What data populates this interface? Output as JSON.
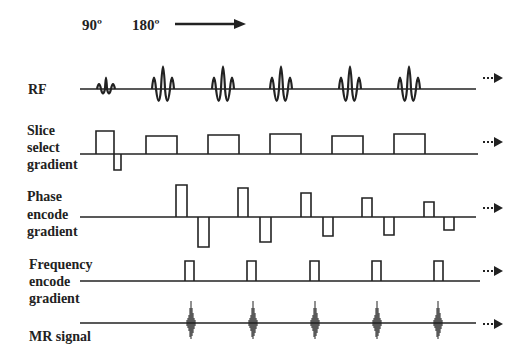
{
  "header": {
    "angle_90": "90º",
    "angle_180": "180º",
    "time_arrow": "right-arrow"
  },
  "rows": [
    {
      "id": "rf",
      "label_lines": [
        "RF"
      ],
      "continuation": "···▶"
    },
    {
      "id": "slice",
      "label_lines": [
        "Slice",
        "select",
        "gradient"
      ],
      "continuation": "···▶"
    },
    {
      "id": "phase",
      "label_lines": [
        "Phase",
        "encode",
        "gradient"
      ],
      "continuation": "···▶"
    },
    {
      "id": "frequency",
      "label_lines": [
        "Frequency",
        "encode",
        "gradient"
      ],
      "continuation": "···▶"
    },
    {
      "id": "mr",
      "label_lines": [
        "MR signal"
      ],
      "continuation": "···▶"
    }
  ],
  "colors": {
    "line": "#222222",
    "background": "#ffffff"
  }
}
